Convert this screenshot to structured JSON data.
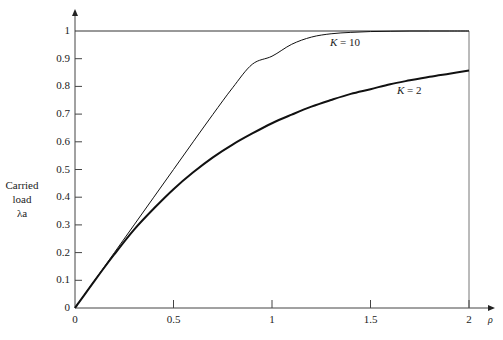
{
  "chart_data": {
    "type": "line",
    "title": "",
    "xlabel": "ρ",
    "ylabel": [
      "Carried",
      "load",
      "λa"
    ],
    "xlim": [
      0,
      2
    ],
    "ylim": [
      0,
      1
    ],
    "xticks": [
      "0",
      "0.5",
      "1",
      "1.5",
      "2"
    ],
    "yticks": [
      "0",
      "0.1",
      "0.2",
      "0.3",
      "0.4",
      "0.5",
      "0.6",
      "0.7",
      "0.8",
      "0.9",
      "1"
    ],
    "grid": false,
    "legend": "inline annotations",
    "x": [
      0,
      0.1,
      0.2,
      0.3,
      0.4,
      0.5,
      0.6,
      0.7,
      0.8,
      0.9,
      1.0,
      1.1,
      1.2,
      1.3,
      1.4,
      1.5,
      1.6,
      1.7,
      1.8,
      1.9,
      2.0
    ],
    "series": [
      {
        "name": "K = 10",
        "values": [
          0,
          0.1,
          0.2,
          0.3,
          0.4,
          0.5,
          0.6,
          0.699,
          0.795,
          0.88,
          0.909,
          0.952,
          0.978,
          0.99,
          0.995,
          0.998,
          0.999,
          1.0,
          1.0,
          1.0,
          1.0
        ]
      },
      {
        "name": "K = 2",
        "values": [
          0,
          0.099,
          0.194,
          0.283,
          0.359,
          0.429,
          0.49,
          0.544,
          0.59,
          0.63,
          0.667,
          0.698,
          0.727,
          0.751,
          0.773,
          0.79,
          0.808,
          0.822,
          0.835,
          0.846,
          0.857
        ]
      }
    ]
  },
  "annotations": {
    "k10": {
      "k": "K",
      "eq": " = 10"
    },
    "k2": {
      "k": "K",
      "eq": " = 2"
    }
  }
}
